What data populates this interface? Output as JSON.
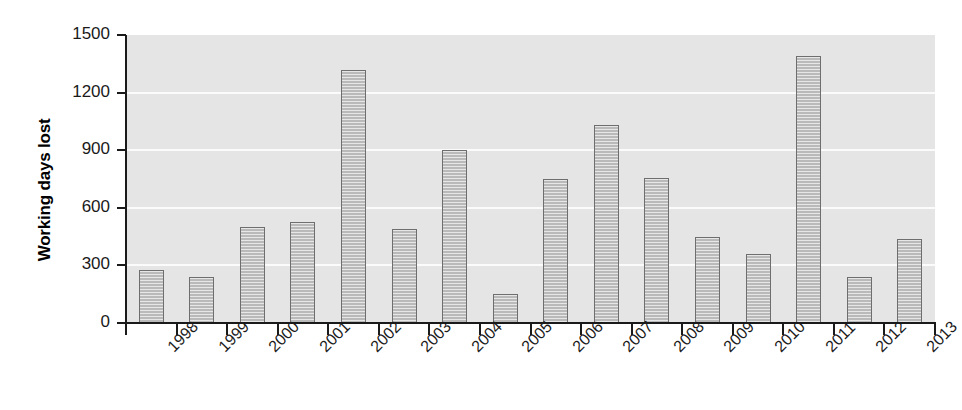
{
  "chart_data": {
    "type": "bar",
    "title": "",
    "xlabel": "",
    "ylabel": "Working days lost",
    "categories": [
      "1998",
      "1999",
      "2000",
      "2001",
      "2002",
      "2003",
      "2004",
      "2005",
      "2006",
      "2007",
      "2008",
      "2009",
      "2010",
      "2011",
      "2012",
      "2013"
    ],
    "values": [
      275,
      240,
      500,
      525,
      1320,
      490,
      900,
      150,
      750,
      1030,
      755,
      450,
      360,
      1390,
      240,
      435
    ],
    "ylim": [
      0,
      1500
    ],
    "yticks": [
      0,
      300,
      600,
      900,
      1200,
      1500
    ],
    "ytick_labels": [
      "0",
      "300",
      "600",
      "900",
      "1200",
      "1500"
    ],
    "grid": "horizontal-white",
    "legend": "none",
    "bar_fill": "#c9c9c9",
    "bar_edge": "#6e6e6e",
    "plot_background": "#e5e5e5",
    "gridline_color": "#fbfbfb",
    "axis_color": "#1a1a1a"
  }
}
